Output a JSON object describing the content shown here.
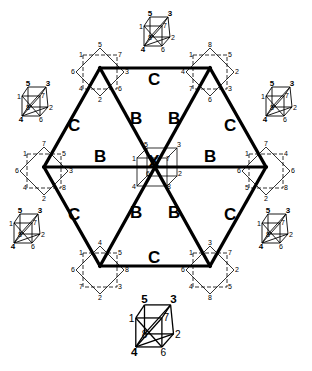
{
  "diagram": {
    "edge_labels": {
      "top": "C",
      "upper_left": "C",
      "upper_right": "C",
      "lower_left": "C",
      "lower_right": "C",
      "bottom": "C",
      "spoke_ul": "B",
      "spoke_ur": "B",
      "spoke_left": "B",
      "spoke_right": "B",
      "spoke_ll": "B",
      "spoke_lr": "B"
    },
    "center_mark": "X",
    "vertex_cubes": [
      {
        "id": "top-left",
        "labels": [
          "1",
          "5",
          "7",
          "6",
          "3",
          "4",
          "2",
          "6"
        ]
      },
      {
        "id": "top-right",
        "labels": [
          "1",
          "8",
          "5",
          "4",
          "2",
          "7",
          "6",
          "3"
        ]
      },
      {
        "id": "left",
        "labels": [
          "1",
          "7",
          "5",
          "6",
          "3",
          "4",
          "2",
          "8"
        ]
      },
      {
        "id": "right",
        "labels": [
          "1",
          "7",
          "4",
          "6",
          "6",
          "5",
          "2",
          "8"
        ]
      },
      {
        "id": "bottom-left",
        "labels": [
          "1",
          "4",
          "5",
          "6",
          "8",
          "7",
          "2",
          "3"
        ]
      },
      {
        "id": "bottom-right",
        "labels": [
          "1",
          "3",
          "7",
          "6",
          "2",
          "4",
          "8",
          "5"
        ]
      }
    ],
    "center_cube": {
      "labels": [
        "5",
        "3",
        "1",
        "7",
        "6",
        "2",
        "4",
        "8"
      ]
    },
    "side_cubes": [
      {
        "id": "top",
        "labels": [
          "5",
          "3",
          "1",
          "7",
          "8",
          "2",
          "4",
          "6"
        ]
      },
      {
        "id": "upper-left",
        "labels": [
          "5",
          "3",
          "1",
          "7",
          "8",
          "2",
          "4",
          "6"
        ]
      },
      {
        "id": "upper-right",
        "labels": [
          "5",
          "3",
          "1",
          "7",
          "8",
          "2",
          "4",
          "6"
        ]
      },
      {
        "id": "lower-left",
        "labels": [
          "5",
          "3",
          "1",
          "7",
          "8",
          "2",
          "4",
          "6"
        ]
      },
      {
        "id": "lower-right",
        "labels": [
          "5",
          "3",
          "1",
          "7",
          "8",
          "2",
          "4",
          "6"
        ]
      },
      {
        "id": "bottom",
        "labels": [
          "5",
          "3",
          "1",
          "7",
          "8",
          "2",
          "4",
          "6"
        ]
      }
    ]
  }
}
